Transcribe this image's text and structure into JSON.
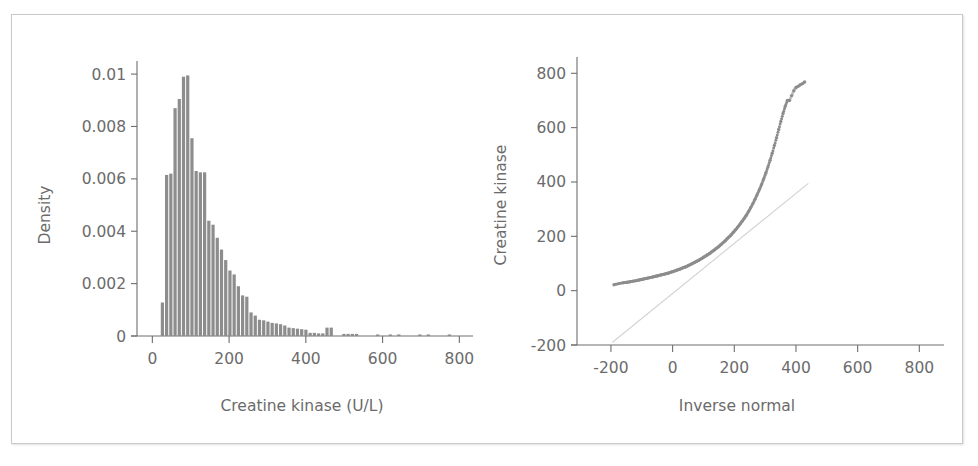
{
  "figure": {
    "background_color": "#ffffff",
    "frame_color": "#c9c9c9",
    "ink_color": "#6b6b6b",
    "bar_color": "#8d8d8d",
    "reference_line_color": "#d2d2d2"
  },
  "chart_data": [
    {
      "id": "histogram",
      "type": "bar",
      "title": "",
      "xlabel": "Creatine kinase (U/L)",
      "ylabel": "Density",
      "xlim": [
        -40,
        820
      ],
      "ylim": [
        0,
        0.0105
      ],
      "xticks": [
        0,
        200,
        400,
        600,
        800
      ],
      "xticklabels": [
        "0",
        "200",
        "400",
        "600",
        "800"
      ],
      "yticks": [
        0,
        0.002,
        0.004,
        0.006,
        0.008,
        0.01
      ],
      "yticklabels": [
        "0",
        "0.002",
        "0.004",
        "0.006",
        "0.008",
        "0.01"
      ],
      "grid": false,
      "legend": "none",
      "bin_width": 11,
      "bin_starts": [
        22,
        33,
        44,
        55,
        66,
        77,
        88,
        99,
        110,
        121,
        132,
        143,
        154,
        165,
        176,
        187,
        198,
        209,
        220,
        231,
        242,
        253,
        264,
        275,
        286,
        297,
        308,
        319,
        330,
        341,
        352,
        363,
        374,
        385,
        396,
        407,
        418,
        429,
        440,
        451,
        462,
        473,
        484,
        495,
        506,
        517,
        528,
        539,
        550,
        561,
        572,
        583,
        594,
        605,
        616,
        627,
        638,
        649,
        660,
        671,
        682,
        693,
        704,
        715,
        726,
        737,
        748,
        759,
        770
      ],
      "values": [
        0.00128,
        0.00615,
        0.0062,
        0.0087,
        0.00905,
        0.0099,
        0.00995,
        0.00755,
        0.0063,
        0.00625,
        0.00625,
        0.0044,
        0.00425,
        0.00375,
        0.0033,
        0.0029,
        0.0025,
        0.00235,
        0.0019,
        0.00155,
        0.0015,
        0.0009,
        0.00078,
        0.00062,
        0.0006,
        0.00055,
        0.0005,
        0.00048,
        0.00045,
        0.0004,
        0.00032,
        0.0003,
        0.00028,
        0.00026,
        0.00024,
        0.00012,
        0.00012,
        0.0001,
        0.0001,
        0.00032,
        0.00032,
        0.0,
        0.0,
        8e-05,
        8e-05,
        8e-05,
        8e-05,
        0.0,
        0.0,
        0.0,
        0.0,
        6e-05,
        0.0,
        0.0,
        6e-05,
        0.0,
        6e-05,
        0.0,
        0.0,
        0.0,
        0.0,
        6e-05,
        0.0,
        6e-05,
        0.0,
        0.0,
        0.0,
        0.0,
        6e-05
      ]
    },
    {
      "id": "qqplot",
      "type": "scatter",
      "title": "",
      "xlabel": "Inverse normal",
      "ylabel": "Creatine kinase",
      "xlim": [
        -310,
        880
      ],
      "ylim": [
        -200,
        860
      ],
      "xticks": [
        -200,
        0,
        200,
        400,
        600,
        800
      ],
      "xticklabels": [
        "-200",
        "0",
        "200",
        "400",
        "600",
        "800"
      ],
      "yticks": [
        -200,
        0,
        200,
        400,
        600,
        800
      ],
      "yticklabels": [
        "-200",
        "0",
        "200",
        "400",
        "600",
        "800"
      ],
      "grid": false,
      "legend": "none",
      "reference_line": {
        "x": [
          -195,
          440
        ],
        "y": [
          -190,
          395
        ]
      },
      "points_x": [
        -190,
        -175,
        -160,
        -148,
        -138,
        -128,
        -118,
        -110,
        -102,
        -94,
        -86,
        -78,
        -70,
        -62,
        -55,
        -48,
        -41,
        -34,
        -27,
        -20,
        -13,
        -6,
        1,
        8,
        15,
        22,
        29,
        36,
        43,
        50,
        57,
        64,
        71,
        78,
        85,
        92,
        99,
        106,
        113,
        120,
        127,
        134,
        141,
        148,
        155,
        162,
        169,
        176,
        183,
        190,
        197,
        204,
        211,
        218,
        225,
        232,
        239,
        246,
        253,
        260,
        267,
        274,
        281,
        288,
        295,
        302,
        309,
        316,
        323,
        330,
        337,
        344,
        351,
        358,
        365,
        372,
        379,
        386,
        393,
        400,
        407,
        414,
        421,
        428
      ],
      "points_y": [
        22,
        26,
        29,
        31,
        33,
        35,
        37,
        39,
        41,
        43,
        45,
        47,
        49,
        51,
        53,
        55,
        57,
        59,
        61,
        63,
        65,
        68,
        70,
        73,
        76,
        79,
        82,
        85,
        88,
        92,
        96,
        100,
        104,
        108,
        112,
        117,
        122,
        127,
        132,
        137,
        143,
        149,
        155,
        161,
        168,
        175,
        182,
        190,
        198,
        206,
        215,
        224,
        234,
        244,
        255,
        266,
        278,
        291,
        305,
        320,
        336,
        353,
        371,
        390,
        410,
        432,
        455,
        480,
        506,
        534,
        563,
        593,
        623,
        652,
        678,
        700,
        700,
        718,
        736,
        748,
        752,
        758,
        762,
        768
      ]
    }
  ]
}
